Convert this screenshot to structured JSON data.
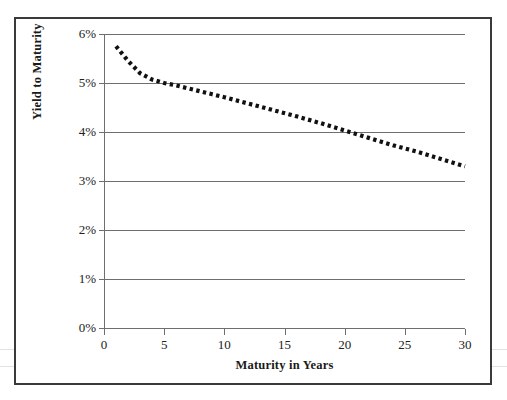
{
  "chart_data": {
    "type": "line",
    "title": "",
    "xlabel": "Maturity in Years",
    "ylabel": "Yield to Maturity",
    "xlim": [
      0,
      30
    ],
    "ylim": [
      0,
      6
    ],
    "grid": true,
    "legend": null,
    "line_style": "dotted",
    "line_color": "#111111",
    "x_ticks": [
      0,
      5,
      10,
      15,
      20,
      25,
      30
    ],
    "x_tick_labels": [
      "0",
      "5",
      "10",
      "15",
      "20",
      "25",
      "30"
    ],
    "y_ticks": [
      0,
      1,
      2,
      3,
      4,
      5,
      6
    ],
    "y_tick_labels": [
      "0%",
      "1%",
      "2%",
      "3%",
      "4%",
      "5%",
      "6%"
    ],
    "series": [
      {
        "name": "Yield curve",
        "x": [
          1,
          2,
          3,
          4,
          5,
          6,
          7,
          8,
          9,
          10,
          12,
          14,
          16,
          18,
          20,
          22,
          24,
          26,
          28,
          30
        ],
        "y": [
          5.75,
          5.45,
          5.2,
          5.07,
          5.0,
          4.95,
          4.89,
          4.83,
          4.77,
          4.71,
          4.58,
          4.45,
          4.32,
          4.18,
          4.03,
          3.88,
          3.73,
          3.6,
          3.45,
          3.3
        ]
      }
    ]
  },
  "axes": {
    "y_title": "Yield to Maturity",
    "x_title": "Maturity in Years",
    "y_labels": [
      "6%",
      "5%",
      "4%",
      "3%",
      "2%",
      "1%",
      "0%"
    ],
    "x_labels": [
      "0",
      "5",
      "10",
      "15",
      "20",
      "25",
      "30"
    ]
  }
}
